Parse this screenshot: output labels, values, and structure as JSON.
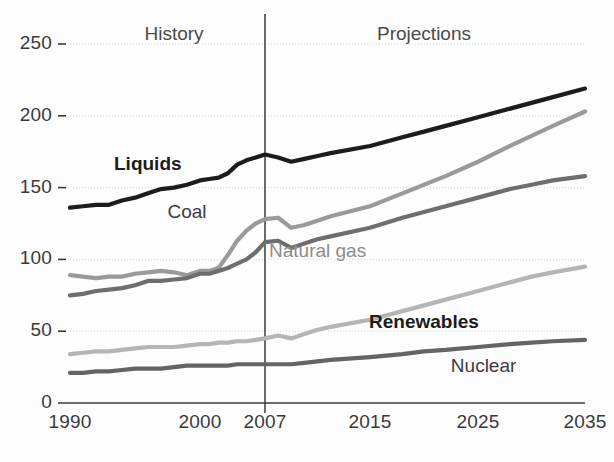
{
  "chart_data": {
    "type": "line",
    "title": "",
    "xlabel": "",
    "ylabel": "",
    "xlim": [
      1990,
      2035
    ],
    "ylim": [
      0,
      260
    ],
    "grid": true,
    "legend_position": "inline-annotations",
    "xticks": [
      "1990",
      "2000",
      "2007",
      "2015",
      "2025",
      "2035"
    ],
    "xtick_values": [
      1990,
      2000,
      2007,
      2015,
      2025,
      2035
    ],
    "yticks": [
      "0",
      "50",
      "100",
      "150",
      "200",
      "250"
    ],
    "ytick_values": [
      0,
      50,
      100,
      150,
      200,
      250
    ],
    "annotations": [
      {
        "text": "History",
        "x": 1998,
        "y": 258
      },
      {
        "text": "Projections",
        "x": 2020,
        "y": 258
      }
    ],
    "divider": {
      "x": 2007,
      "label": "2007"
    },
    "series": [
      {
        "name": "Liquids",
        "color": "#1c1c1c",
        "label_x": 1996.0,
        "label_y": 166,
        "x": [
          1990,
          1991,
          1992,
          1993,
          1994,
          1995,
          1996,
          1997,
          1998,
          1999,
          2000,
          2001,
          2002,
          2003,
          2004,
          2005,
          2006,
          2007,
          2008,
          2009,
          2010,
          2011,
          2012,
          2015,
          2018,
          2020,
          2022,
          2025,
          2028,
          2030,
          2032,
          2035
        ],
        "values": [
          136,
          137,
          138,
          138,
          141,
          143,
          146,
          149,
          150,
          152,
          155,
          156,
          157,
          160,
          166,
          169,
          171,
          173,
          171,
          168,
          170,
          172,
          174,
          179,
          185,
          189,
          193,
          199,
          205,
          209,
          213,
          219
        ]
      },
      {
        "name": "Coal",
        "color": "#9a9a9a",
        "label_x": 1999.0,
        "label_y": 132,
        "x": [
          1990,
          1991,
          1992,
          1993,
          1994,
          1995,
          1996,
          1997,
          1998,
          1999,
          2000,
          2001,
          2002,
          2003,
          2004,
          2005,
          2006,
          2007,
          2008,
          2009,
          2010,
          2011,
          2012,
          2015,
          2018,
          2020,
          2022,
          2025,
          2028,
          2030,
          2032,
          2035
        ],
        "values": [
          89,
          88,
          87,
          88,
          88,
          90,
          91,
          92,
          91,
          89,
          92,
          92,
          94,
          103,
          113,
          120,
          125,
          128,
          129,
          122,
          124,
          127,
          130,
          137,
          146,
          152,
          158,
          168,
          179,
          186,
          193,
          203
        ]
      },
      {
        "name": "Natural gas",
        "color": "#6e6e6e",
        "label_x": 2011.0,
        "label_y": 105,
        "x": [
          1990,
          1991,
          1992,
          1993,
          1994,
          1995,
          1996,
          1997,
          1998,
          1999,
          2000,
          2001,
          2002,
          2003,
          2004,
          2005,
          2006,
          2007,
          2008,
          2009,
          2010,
          2011,
          2012,
          2015,
          2018,
          2020,
          2022,
          2025,
          2028,
          2030,
          2032,
          2035
        ],
        "values": [
          75,
          76,
          78,
          79,
          80,
          82,
          85,
          85,
          86,
          87,
          90,
          90,
          92,
          94,
          97,
          100,
          105,
          112,
          113,
          108,
          111,
          114,
          116,
          122,
          129,
          133,
          137,
          143,
          149,
          152,
          155,
          158
        ]
      },
      {
        "name": "Renewables",
        "color": "#b5b5b5",
        "label_x": 2020.0,
        "label_y": 56,
        "label_bold": true,
        "x": [
          1990,
          1991,
          1992,
          1993,
          1994,
          1995,
          1996,
          1997,
          1998,
          1999,
          2000,
          2001,
          2002,
          2003,
          2004,
          2005,
          2006,
          2007,
          2008,
          2009,
          2010,
          2011,
          2012,
          2015,
          2018,
          2020,
          2022,
          2025,
          2028,
          2030,
          2032,
          2035
        ],
        "values": [
          34,
          35,
          36,
          36,
          37,
          38,
          39,
          39,
          39,
          40,
          41,
          41,
          42,
          42,
          43,
          43,
          44,
          45,
          47,
          45,
          48,
          51,
          53,
          58,
          64,
          68,
          72,
          78,
          84,
          88,
          91,
          95
        ]
      },
      {
        "name": "Nuclear",
        "color": "#646464",
        "label_x": 2025.5,
        "label_y": 25,
        "x": [
          1990,
          1991,
          1992,
          1993,
          1994,
          1995,
          1996,
          1997,
          1998,
          1999,
          2000,
          2001,
          2002,
          2003,
          2004,
          2005,
          2006,
          2007,
          2008,
          2009,
          2010,
          2011,
          2012,
          2015,
          2018,
          2020,
          2022,
          2025,
          2028,
          2030,
          2032,
          2035
        ],
        "values": [
          21,
          21,
          22,
          22,
          23,
          24,
          24,
          24,
          25,
          26,
          26,
          26,
          26,
          26,
          27,
          27,
          27,
          27,
          27,
          27,
          28,
          29,
          30,
          32,
          34,
          36,
          37,
          39,
          41,
          42,
          43,
          44
        ]
      }
    ]
  }
}
